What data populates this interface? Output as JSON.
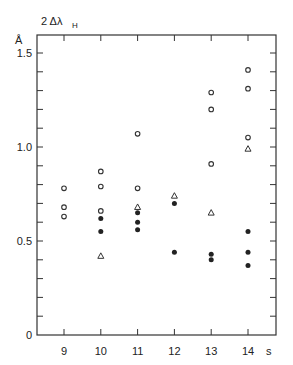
{
  "chart_data": {
    "type": "scatter",
    "title": "",
    "ylabel_top": "2 Δλ",
    "ylabel_sub": "H",
    "yunit": "Å",
    "xlabel": "s",
    "xlim": [
      8.25,
      15.0
    ],
    "ylim": [
      0,
      1.6
    ],
    "xticks": [
      9,
      10,
      11,
      12,
      13,
      14
    ],
    "yticks": [
      0,
      0.5,
      1.0,
      1.5
    ],
    "ytick_labels": [
      "0",
      "0.5",
      "1.0",
      "1.5"
    ],
    "minor_ytick_step": 0.1,
    "grid": false,
    "legend": "none",
    "series": [
      {
        "name": "open circles",
        "marker": "open-circle",
        "points": [
          [
            9,
            0.78
          ],
          [
            9,
            0.68
          ],
          [
            9,
            0.63
          ],
          [
            10,
            0.87
          ],
          [
            10,
            0.79
          ],
          [
            10,
            0.66
          ],
          [
            11,
            1.07
          ],
          [
            11,
            0.78
          ],
          [
            13,
            1.29
          ],
          [
            13,
            1.2
          ],
          [
            13,
            0.91
          ],
          [
            14,
            1.41
          ],
          [
            14,
            1.31
          ],
          [
            14,
            1.05
          ]
        ]
      },
      {
        "name": "filled circles",
        "marker": "filled-circle",
        "points": [
          [
            10,
            0.62
          ],
          [
            10,
            0.55
          ],
          [
            11,
            0.65
          ],
          [
            11,
            0.6
          ],
          [
            11,
            0.56
          ],
          [
            12,
            0.7
          ],
          [
            12,
            0.44
          ],
          [
            13,
            0.43
          ],
          [
            13,
            0.4
          ],
          [
            14,
            0.55
          ],
          [
            14,
            0.44
          ],
          [
            14,
            0.37
          ]
        ]
      },
      {
        "name": "open triangles",
        "marker": "open-triangle",
        "points": [
          [
            10,
            0.42
          ],
          [
            11,
            0.68
          ],
          [
            12,
            0.74
          ],
          [
            13,
            0.65
          ],
          [
            14,
            0.99
          ]
        ]
      }
    ]
  }
}
